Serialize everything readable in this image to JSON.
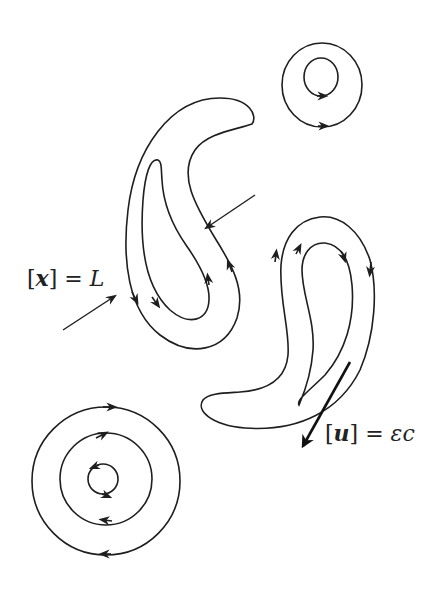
{
  "diagram": {
    "stroke_color": "#1e1e1e",
    "background": "#ffffff",
    "labels": {
      "length_scale": {
        "open": "[",
        "var": "x",
        "close": "]",
        "eq": " = ",
        "rhs": "L"
      },
      "velocity_scale": {
        "open": "[",
        "var": "u",
        "close": "]",
        "eq": " = ",
        "rhs": "εc"
      }
    },
    "elements": [
      {
        "name": "small-vortex-top-right",
        "shape": "concentric-loops",
        "count": 2
      },
      {
        "name": "comma-vortex-left",
        "shape": "nested-comma-loops",
        "count": 2
      },
      {
        "name": "comma-vortex-right",
        "shape": "nested-comma-loops",
        "count": 2
      },
      {
        "name": "circular-vortex-bottom-left",
        "shape": "concentric-circles",
        "count": 3
      }
    ]
  }
}
